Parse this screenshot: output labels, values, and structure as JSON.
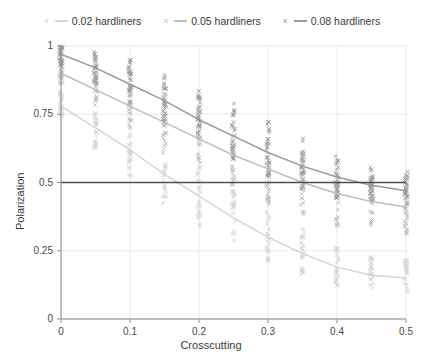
{
  "chart_data": {
    "type": "scatter",
    "title": "",
    "xlabel": "Crosscutting",
    "ylabel": "Polarization",
    "xlim": [
      0,
      0.5
    ],
    "ylim": [
      0,
      1
    ],
    "xticks": [
      "0",
      "0.1",
      "0.2",
      "0.3",
      "0.4",
      "0.5"
    ],
    "xtick_values": [
      0,
      0.1,
      0.2,
      0.3,
      0.4,
      0.5
    ],
    "yticks": [
      "0",
      "0.25",
      "0.5",
      "0.75",
      "1"
    ],
    "ytick_values": [
      0,
      0.25,
      0.5,
      0.75,
      1
    ],
    "grid": "light vertical and horizontal gridlines at ticks",
    "legend_position": "top-center-horizontal",
    "reference_line": {
      "type": "horizontal",
      "y": 0.5,
      "color": "#4d4d4d"
    },
    "marker": "x",
    "x": [
      0,
      0.05,
      0.1,
      0.15,
      0.2,
      0.25,
      0.3,
      0.35,
      0.4,
      0.45,
      0.5
    ],
    "series": [
      {
        "name": "0.02 hardliners",
        "color": "#d6d6d6",
        "fit_curve": [
          0.78,
          0.7,
          0.62,
          0.53,
          0.45,
          0.37,
          0.3,
          0.24,
          0.19,
          0.16,
          0.15
        ],
        "scatter_spread": [
          {
            "x": 0.0,
            "lo": 0.74,
            "hi": 0.84
          },
          {
            "x": 0.05,
            "lo": 0.62,
            "hi": 0.76
          },
          {
            "x": 0.1,
            "lo": 0.52,
            "hi": 0.7
          },
          {
            "x": 0.15,
            "lo": 0.42,
            "hi": 0.63
          },
          {
            "x": 0.2,
            "lo": 0.34,
            "hi": 0.56
          },
          {
            "x": 0.25,
            "lo": 0.27,
            "hi": 0.48
          },
          {
            "x": 0.3,
            "lo": 0.21,
            "hi": 0.4
          },
          {
            "x": 0.35,
            "lo": 0.16,
            "hi": 0.33
          },
          {
            "x": 0.4,
            "lo": 0.12,
            "hi": 0.27
          },
          {
            "x": 0.45,
            "lo": 0.11,
            "hi": 0.23
          },
          {
            "x": 0.5,
            "lo": 0.1,
            "hi": 0.22
          }
        ]
      },
      {
        "name": "0.05 hardliners",
        "color": "#bcbcbc",
        "fit_curve": [
          0.9,
          0.84,
          0.78,
          0.72,
          0.66,
          0.6,
          0.55,
          0.5,
          0.46,
          0.43,
          0.41
        ],
        "scatter_spread": [
          {
            "x": 0.0,
            "lo": 0.86,
            "hi": 0.96
          },
          {
            "x": 0.05,
            "lo": 0.78,
            "hi": 0.92
          },
          {
            "x": 0.1,
            "lo": 0.7,
            "hi": 0.88
          },
          {
            "x": 0.15,
            "lo": 0.62,
            "hi": 0.83
          },
          {
            "x": 0.2,
            "lo": 0.55,
            "hi": 0.78
          },
          {
            "x": 0.25,
            "lo": 0.48,
            "hi": 0.71
          },
          {
            "x": 0.3,
            "lo": 0.42,
            "hi": 0.65
          },
          {
            "x": 0.35,
            "lo": 0.37,
            "hi": 0.6
          },
          {
            "x": 0.4,
            "lo": 0.34,
            "hi": 0.55
          },
          {
            "x": 0.45,
            "lo": 0.32,
            "hi": 0.51
          },
          {
            "x": 0.5,
            "lo": 0.31,
            "hi": 0.49
          }
        ]
      },
      {
        "name": "0.08 hardliners",
        "color": "#9a9a9a",
        "fit_curve": [
          0.97,
          0.92,
          0.86,
          0.8,
          0.73,
          0.67,
          0.61,
          0.56,
          0.52,
          0.49,
          0.47
        ],
        "scatter_spread": [
          {
            "x": 0.0,
            "lo": 0.93,
            "hi": 1.0
          },
          {
            "x": 0.05,
            "lo": 0.86,
            "hi": 0.98
          },
          {
            "x": 0.1,
            "lo": 0.79,
            "hi": 0.95
          },
          {
            "x": 0.15,
            "lo": 0.72,
            "hi": 0.9
          },
          {
            "x": 0.2,
            "lo": 0.65,
            "hi": 0.85
          },
          {
            "x": 0.25,
            "lo": 0.58,
            "hi": 0.79
          },
          {
            "x": 0.3,
            "lo": 0.52,
            "hi": 0.73
          },
          {
            "x": 0.35,
            "lo": 0.47,
            "hi": 0.67
          },
          {
            "x": 0.4,
            "lo": 0.44,
            "hi": 0.61
          },
          {
            "x": 0.45,
            "lo": 0.42,
            "hi": 0.56
          },
          {
            "x": 0.5,
            "lo": 0.41,
            "hi": 0.54
          }
        ]
      }
    ]
  },
  "legend": {
    "entries": [
      {
        "label": "0.02 hardliners",
        "marker": "x-marker-icon",
        "color": "#d6d6d6"
      },
      {
        "label": "0.05 hardliners",
        "marker": "x-marker-icon",
        "color": "#bcbcbc"
      },
      {
        "label": "0.08 hardliners",
        "marker": "x-marker-icon",
        "color": "#9a9a9a"
      }
    ]
  },
  "axes": {
    "x_title": "Crosscutting",
    "y_title": "Polarization",
    "x_tick_labels": [
      "0",
      "0.1",
      "0.2",
      "0.3",
      "0.4",
      "0.5"
    ],
    "y_tick_labels": [
      "0",
      "0.25",
      "0.5",
      "0.75",
      "1"
    ]
  },
  "colors": {
    "background": "#ffffff",
    "grid": "#e8e8e8",
    "axis": "#8c8c8c",
    "text": "#3a3a3a",
    "reference_line": "#4d4d4d"
  }
}
